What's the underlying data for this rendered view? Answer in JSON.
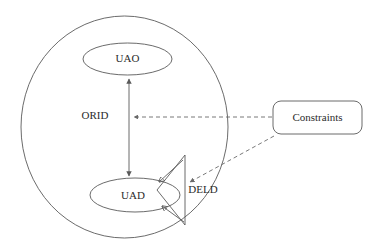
{
  "diagram": {
    "background_color": "#ffffff",
    "stroke_color": "#5a5a5a",
    "text_color": "#2c2c2c",
    "dashed_stroke_color": "#6a6a6a"
  },
  "nodes": {
    "boundary": {
      "label": "",
      "shape": "ellipse",
      "cx": 124.5,
      "cy": 127,
      "rx": 103.5,
      "ry": 111
    },
    "uao": {
      "label": "UAO",
      "shape": "ellipse",
      "cx": 127.5,
      "cy": 59,
      "rx": 44.5,
      "ry": 16
    },
    "uad": {
      "label": "UAD",
      "shape": "ellipse",
      "cx": 135,
      "cy": 195,
      "rx": 45,
      "ry": 17
    },
    "orid": {
      "label": "ORID",
      "shape": "text",
      "x": 95,
      "y": 116
    },
    "deld": {
      "label": "DELD",
      "shape": "text",
      "x": 203,
      "y": 190
    },
    "constraints": {
      "label": "Constraints",
      "shape": "rounded-rect",
      "x": 273,
      "y": 101,
      "width": 89,
      "height": 33,
      "corner_radius": 8
    }
  },
  "connectors": {
    "uao_uad_bidirectional": {
      "label": "",
      "style": "solid",
      "arrowheads": "both",
      "from": "uad",
      "to": "uao",
      "x": 129,
      "y_top": 77,
      "y_bottom": 178
    },
    "constraints_to_orid": {
      "label": "",
      "style": "dashed",
      "arrowheads": "end",
      "from": "constraints",
      "to": "orid"
    },
    "constraints_to_deld": {
      "label": "",
      "style": "dashed",
      "arrowheads": "end",
      "from": "constraints",
      "to": "deld"
    },
    "deld_to_uad_upper": {
      "label": "",
      "style": "solid",
      "arrowheads": "end",
      "from": "deld",
      "to": "uad"
    },
    "deld_to_uad_lower": {
      "label": "",
      "style": "solid",
      "arrowheads": "end",
      "from": "deld",
      "to": "uad"
    }
  }
}
